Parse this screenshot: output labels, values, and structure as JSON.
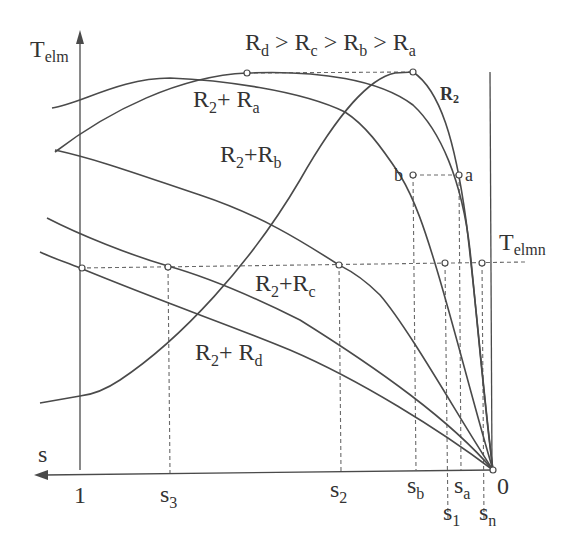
{
  "diagram": {
    "title_relation": {
      "parts": [
        "R",
        "d",
        " > R",
        "c",
        " > R",
        "b",
        " > R",
        "a"
      ]
    },
    "axes": {
      "y_label_main": "T",
      "y_label_sub": "elm",
      "x_label": "s",
      "origin_label": "0",
      "x_one_label": "1"
    },
    "reference_line": {
      "label_main": "T",
      "label_sub": "elmn"
    },
    "curves": [
      {
        "id": "R2",
        "label_main": "R",
        "label_sub": "2",
        "bold": true
      },
      {
        "id": "R2+Ra",
        "label_main": "R",
        "label_sub": "2",
        "plus": "+ R",
        "label_sub2": "a"
      },
      {
        "id": "R2+Rb",
        "label_main": "R",
        "label_sub": "2",
        "plus": "+R",
        "label_sub2": "b"
      },
      {
        "id": "R2+Rc",
        "label_main": "R",
        "label_sub": "2",
        "plus": "+R",
        "label_sub2": "c"
      },
      {
        "id": "R2+Rd",
        "label_main": "R",
        "label_sub": "2",
        "plus": "+ R",
        "label_sub2": "d"
      }
    ],
    "points": {
      "a": "a",
      "b": "b"
    },
    "x_ticks": [
      {
        "main": "s",
        "sub": "3"
      },
      {
        "main": "s",
        "sub": "2"
      },
      {
        "main": "s",
        "sub": "b"
      },
      {
        "main": "s",
        "sub": "a"
      },
      {
        "main": "s",
        "sub": "1"
      },
      {
        "main": "s",
        "sub": "n"
      }
    ]
  }
}
